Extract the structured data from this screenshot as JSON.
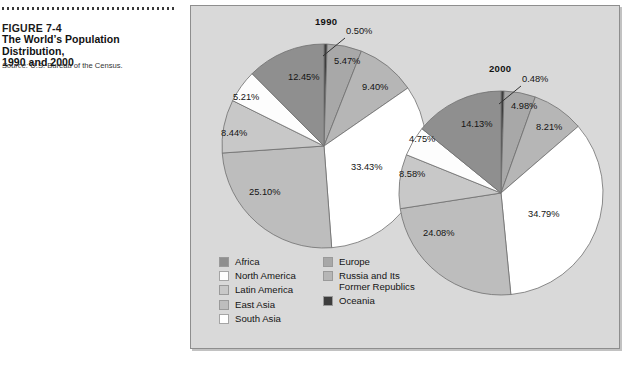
{
  "caption": {
    "figure_number": "FIGURE 7-4",
    "title_line1": "The World’s Population Distribution,",
    "title_line2": "1990 and 2000",
    "source_label": "Source:",
    "source_text": " U.S. Bureau of the Census."
  },
  "legend": {
    "column1": [
      {
        "label": "Africa",
        "color": "#8f8f8f"
      },
      {
        "label": "North America",
        "color": "#fdfdfd"
      },
      {
        "label": "Latin America",
        "color": "#c8c8c8"
      },
      {
        "label": "East Asia",
        "color": "#bdbdbd"
      },
      {
        "label": "South Asia",
        "color": "#ffffff"
      }
    ],
    "column2": [
      {
        "label": "Europe",
        "color": "#a8a8a8"
      },
      {
        "label": "Russia and Its\nFormer Republics",
        "color": "#b6b6b6"
      },
      {
        "label": "Oceania",
        "color": "#3d3d3d"
      }
    ]
  },
  "chart_data": {
    "type": "pie",
    "title": "The World’s Population Distribution, 1990 and 2000",
    "figure_number": "FIGURE 7-4",
    "source": "U.S. Bureau of the Census",
    "legend_position": "bottom-left",
    "grid": false,
    "unit": "%",
    "categories": [
      "Oceania",
      "Europe",
      "Russia and Its Former Republics",
      "South Asia",
      "East Asia",
      "Latin America",
      "North America",
      "Africa"
    ],
    "colors": {
      "Oceania": "#3d3d3d",
      "Europe": "#a8a8a8",
      "Russia and Its Former Republics": "#b6b6b6",
      "South Asia": "#ffffff",
      "East Asia": "#bdbdbd",
      "Latin America": "#c8c8c8",
      "North America": "#fdfdfd",
      "Africa": "#8f8f8f"
    },
    "series": [
      {
        "name": "1990",
        "title": "1990",
        "values": [
          0.5,
          5.47,
          9.4,
          33.43,
          25.1,
          8.44,
          5.21,
          12.45
        ],
        "labels": [
          "0.50%",
          "5.47%",
          "9.40%",
          "33.43%",
          "25.10%",
          "8.44%",
          "5.21%",
          "12.45%"
        ]
      },
      {
        "name": "2000",
        "title": "2000",
        "values": [
          0.48,
          4.98,
          8.21,
          34.79,
          24.08,
          8.58,
          4.75,
          14.13
        ],
        "labels": [
          "0.48%",
          "4.98%",
          "8.21%",
          "34.79%",
          "24.08%",
          "8.58%",
          "4.75%",
          "14.13%"
        ]
      }
    ]
  },
  "pies": {
    "p1990": {
      "title": "1990",
      "labels": {
        "oceania": "0.50%",
        "europe": "5.47%",
        "russia": "9.40%",
        "south_asia": "33.43%",
        "east_asia": "25.10%",
        "latin_america": "8.44%",
        "north_america": "5.21%",
        "africa": "12.45%"
      }
    },
    "p2000": {
      "title": "2000",
      "labels": {
        "oceania": "0.48%",
        "europe": "4.98%",
        "russia": "8.21%",
        "south_asia": "34.79%",
        "east_asia": "24.08%",
        "latin_america": "8.58%",
        "north_america": "4.75%",
        "africa": "14.13%"
      }
    }
  }
}
